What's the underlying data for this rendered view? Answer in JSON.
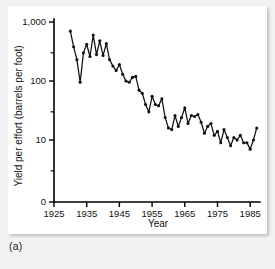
{
  "figure": {
    "panel_label": "(a)"
  },
  "chart_data": {
    "type": "line",
    "title": "",
    "xlabel": "Year",
    "ylabel": "Yield per effort (barrels per foot)",
    "yscale": "log",
    "ylim": [
      5,
      1000
    ],
    "xlim": [
      1925,
      1988
    ],
    "grid": false,
    "legend": null,
    "y_tick_labels": [
      "1,000",
      "100",
      "10",
      "0"
    ],
    "y_tick_values": [
      1000,
      100,
      10,
      0
    ],
    "y_minor_tick_values": [
      300,
      30,
      3
    ],
    "x_tick_labels": [
      "1925",
      "1935",
      "1945",
      "1955",
      "1965",
      "1975",
      "1985"
    ],
    "x_tick_values": [
      1925,
      1935,
      1945,
      1955,
      1965,
      1975,
      1985
    ],
    "marker": "filled-circle",
    "x": [
      1930,
      1931,
      1932,
      1933,
      1934,
      1935,
      1936,
      1937,
      1938,
      1939,
      1940,
      1941,
      1942,
      1943,
      1944,
      1945,
      1946,
      1947,
      1948,
      1949,
      1950,
      1951,
      1952,
      1953,
      1954,
      1955,
      1956,
      1957,
      1958,
      1959,
      1960,
      1961,
      1962,
      1963,
      1964,
      1965,
      1966,
      1967,
      1968,
      1969,
      1970,
      1971,
      1972,
      1973,
      1974,
      1975,
      1976,
      1977,
      1978,
      1979,
      1980,
      1981,
      1982,
      1983,
      1984,
      1985,
      1986,
      1987
    ],
    "values": [
      700,
      380,
      230,
      95,
      300,
      420,
      260,
      600,
      280,
      480,
      270,
      430,
      230,
      180,
      150,
      190,
      130,
      100,
      95,
      115,
      120,
      70,
      62,
      40,
      30,
      55,
      40,
      38,
      50,
      24,
      16,
      15,
      26,
      17,
      24,
      35,
      19,
      26,
      25,
      27,
      20,
      13,
      17,
      19,
      12,
      14,
      9,
      15,
      11,
      8,
      11,
      10,
      12,
      9,
      9,
      7,
      10,
      16
    ],
    "series": [
      {
        "name": "Yield per effort",
        "values": [
          700,
          380,
          230,
          95,
          300,
          420,
          260,
          600,
          280,
          480,
          270,
          430,
          230,
          180,
          150,
          190,
          130,
          100,
          95,
          115,
          120,
          70,
          62,
          40,
          30,
          55,
          40,
          38,
          50,
          24,
          16,
          15,
          26,
          17,
          24,
          35,
          19,
          26,
          25,
          27,
          20,
          13,
          17,
          19,
          12,
          14,
          9,
          15,
          11,
          8,
          11,
          10,
          12,
          9,
          9,
          7,
          10,
          16
        ]
      }
    ]
  }
}
